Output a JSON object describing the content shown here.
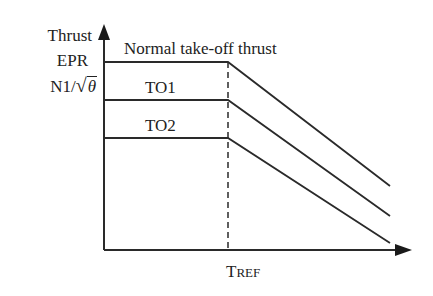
{
  "diagram": {
    "y_axis_labels": [
      "Thrust",
      "EPR",
      "N1/√θ"
    ],
    "y_axis_label_parts": {
      "n1": "N1/",
      "sqrt": "√",
      "theta": "θ"
    },
    "x_axis_label": {
      "main": "T",
      "sub": "REF",
      "full": "TREF"
    },
    "curves": [
      {
        "label": "Normal take-off thrust",
        "flat_y": 62,
        "end_y": 186
      },
      {
        "label": "TO1",
        "flat_y": 100,
        "end_y": 216
      },
      {
        "label": "TO2",
        "flat_y": 138,
        "end_y": 243
      }
    ],
    "line_color": "#2a2a2a"
  }
}
